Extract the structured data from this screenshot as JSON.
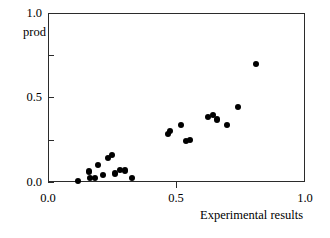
{
  "chart_data": {
    "type": "scatter",
    "title": "",
    "xlabel": "Experimental results",
    "ylabel": "prod",
    "xlim": [
      0.0,
      1.0
    ],
    "ylim": [
      0.0,
      1.0
    ],
    "grid": false,
    "legend": null,
    "xticks": [
      0.0,
      0.5,
      1.0
    ],
    "xtick_labels": [
      "0.0",
      "0.5",
      "1.0"
    ],
    "yticks": [
      0.0,
      0.25,
      0.5,
      0.75,
      1.0
    ],
    "ytick_labels": [
      "0.0",
      "",
      "0.5",
      "",
      "1.0"
    ],
    "ytick_labels_major": [
      "0.0",
      "0.5",
      "1.0"
    ],
    "marker": {
      "shape": "circle",
      "color": "#000000",
      "size_px": 6
    },
    "frame_color": "#2b2b2b",
    "background_color": "#ffffff",
    "n_points": 24,
    "points": [
      {
        "x": 0.117,
        "y": 0.004
      },
      {
        "x": 0.158,
        "y": 0.062
      },
      {
        "x": 0.162,
        "y": 0.024
      },
      {
        "x": 0.183,
        "y": 0.024
      },
      {
        "x": 0.193,
        "y": 0.1
      },
      {
        "x": 0.214,
        "y": 0.041
      },
      {
        "x": 0.233,
        "y": 0.14
      },
      {
        "x": 0.249,
        "y": 0.16
      },
      {
        "x": 0.261,
        "y": 0.05
      },
      {
        "x": 0.28,
        "y": 0.071
      },
      {
        "x": 0.299,
        "y": 0.068
      },
      {
        "x": 0.327,
        "y": 0.024
      },
      {
        "x": 0.467,
        "y": 0.284
      },
      {
        "x": 0.475,
        "y": 0.302
      },
      {
        "x": 0.518,
        "y": 0.337
      },
      {
        "x": 0.538,
        "y": 0.243
      },
      {
        "x": 0.553,
        "y": 0.248
      },
      {
        "x": 0.623,
        "y": 0.384
      },
      {
        "x": 0.642,
        "y": 0.396
      },
      {
        "x": 0.658,
        "y": 0.37
      },
      {
        "x": 0.697,
        "y": 0.336
      },
      {
        "x": 0.739,
        "y": 0.442
      },
      {
        "x": 0.808,
        "y": 0.7
      }
    ]
  },
  "axes": {
    "y": {
      "title": "prod",
      "tick_labels": [
        {
          "value": 1.0,
          "label": "1.0"
        },
        {
          "value": 0.5,
          "label": "0.5"
        },
        {
          "value": 0.0,
          "label": "0.0"
        }
      ],
      "minor_ticks": [
        0.75,
        0.25
      ]
    },
    "x": {
      "title": "Experimental results",
      "tick_labels": [
        {
          "value": 0.0,
          "label": "0.0"
        },
        {
          "value": 0.5,
          "label": "0.5"
        },
        {
          "value": 1.0,
          "label": "1.0"
        }
      ]
    }
  }
}
